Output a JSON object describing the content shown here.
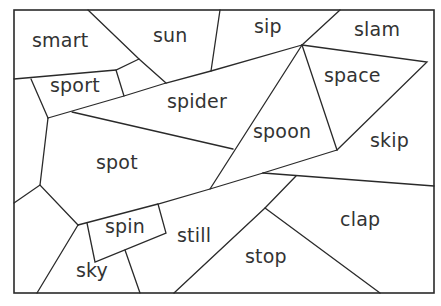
{
  "worksheet": {
    "words": [
      {
        "id": "smart",
        "label": "smart",
        "x": 32,
        "y": 31
      },
      {
        "id": "sun",
        "label": "sun",
        "x": 153,
        "y": 26
      },
      {
        "id": "sip",
        "label": "sip",
        "x": 254,
        "y": 17
      },
      {
        "id": "slam",
        "label": "slam",
        "x": 354,
        "y": 20
      },
      {
        "id": "sport",
        "label": "sport",
        "x": 50,
        "y": 76
      },
      {
        "id": "spider",
        "label": "spider",
        "x": 167,
        "y": 92
      },
      {
        "id": "space",
        "label": "space",
        "x": 324,
        "y": 66
      },
      {
        "id": "spoon",
        "label": "spoon",
        "x": 253,
        "y": 122
      },
      {
        "id": "skip",
        "label": "skip",
        "x": 370,
        "y": 131
      },
      {
        "id": "spot",
        "label": "spot",
        "x": 96,
        "y": 153
      },
      {
        "id": "spin",
        "label": "spin",
        "x": 105,
        "y": 217
      },
      {
        "id": "still",
        "label": "still",
        "x": 177,
        "y": 226
      },
      {
        "id": "clap",
        "label": "clap",
        "x": 340,
        "y": 210
      },
      {
        "id": "stop",
        "label": "stop",
        "x": 245,
        "y": 247
      },
      {
        "id": "sky",
        "label": "sky",
        "x": 76,
        "y": 261
      }
    ],
    "colors": {
      "line": "#2a2a2a",
      "text": "#333333",
      "background": "#ffffff"
    }
  }
}
